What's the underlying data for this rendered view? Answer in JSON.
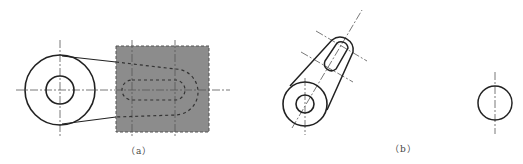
{
  "figures": [
    {
      "id": "a",
      "label": "（a）",
      "description": "Orthographic view: circular boss with hole connected by tangent lines to a shaded rectangular plate containing a hidden slot outline"
    },
    {
      "id": "b",
      "label": "（b）",
      "description": "Oblique view of slotted arm rotated about boss, plus separate circle with vertical centerline"
    }
  ],
  "colors": {
    "line": "#222222",
    "shade": "#8c8c8c",
    "center": "#555555"
  }
}
